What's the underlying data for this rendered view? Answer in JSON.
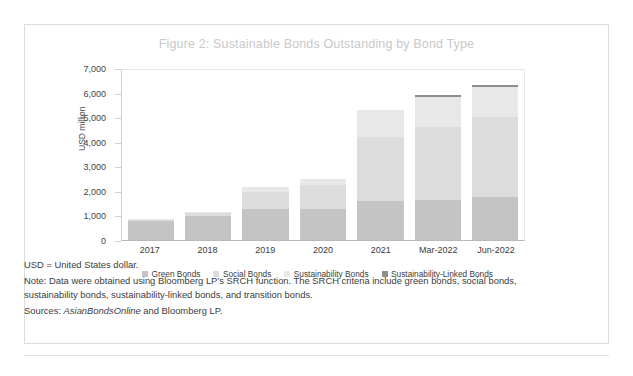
{
  "figure": {
    "title": "Figure 2: Sustainable Bonds Outstanding by Bond Type"
  },
  "notes": {
    "abbrev": "USD = United States dollar.",
    "note": "Note: Data were obtained using Bloomberg LP’s SRCH function. The SRCH criteria include green bonds, social bonds, sustainability bonds, sustainability-linked bonds, and transition bonds.",
    "sources_prefix": "Sources: ",
    "sources_italic": "AsianBondsOnline",
    "sources_suffix": " and Bloomberg LP."
  },
  "colors": {
    "green_bonds": "#c4c4c4",
    "social_bonds": "#dcdcdc",
    "sustainability_bonds": "#e8e8e8",
    "sustainability_linked_bonds": "#8e8e8e",
    "axis": "#b9b9b9",
    "title": "#c9c9c9",
    "frame": "#dcdcdc"
  },
  "chart_data": {
    "type": "bar",
    "stacked": true,
    "title": "Figure 2: Sustainable Bonds Outstanding by Bond Type",
    "xlabel": "",
    "ylabel": "USD million",
    "ylim": [
      0,
      7000
    ],
    "yticks": [
      "0",
      "1,000",
      "2,000",
      "3,000",
      "4,000",
      "5,000",
      "6,000",
      "7,000"
    ],
    "ytick_values": [
      0,
      1000,
      2000,
      3000,
      4000,
      5000,
      6000,
      7000
    ],
    "grid": false,
    "legend_position": "bottom",
    "categories": [
      "2017",
      "2018",
      "2019",
      "2020",
      "2021",
      "Mar-2022",
      "Jun-2022"
    ],
    "series": [
      {
        "name": "Green Bonds",
        "color": "#c4c4c4",
        "values": [
          760,
          980,
          1250,
          1250,
          1600,
          1620,
          1750
        ]
      },
      {
        "name": "Social Bonds",
        "color": "#dcdcdc",
        "values": [
          60,
          130,
          700,
          980,
          2600,
          3000,
          3250
        ]
      },
      {
        "name": "Sustainability Bonds",
        "color": "#e8e8e8",
        "values": [
          30,
          40,
          200,
          270,
          1100,
          1210,
          1230
        ]
      },
      {
        "name": "Sustainability-Linked Bonds",
        "color": "#8e8e8e",
        "values": [
          0,
          0,
          0,
          0,
          0,
          90,
          90
        ]
      }
    ],
    "totals": [
      850,
      1150,
      2150,
      2500,
      5300,
      5920,
      6320
    ]
  }
}
